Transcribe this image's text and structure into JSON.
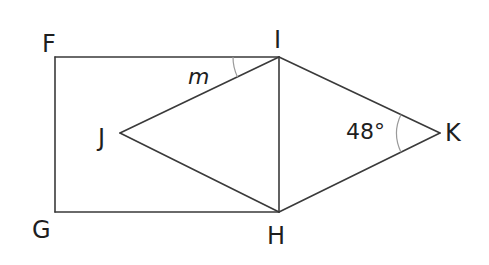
{
  "diagram": {
    "points": {
      "F": {
        "label": "F",
        "x": 55,
        "y": 57
      },
      "I": {
        "label": "I",
        "x": 279,
        "y": 57
      },
      "G": {
        "label": "G",
        "x": 55,
        "y": 212
      },
      "H": {
        "label": "H",
        "x": 279,
        "y": 212
      },
      "J": {
        "label": "J",
        "x": 120,
        "y": 133
      },
      "K": {
        "label": "K",
        "x": 440,
        "y": 133
      }
    },
    "segments": [
      "FI",
      "FG",
      "GH",
      "IH",
      "JI",
      "JH",
      "IK",
      "HK"
    ],
    "angles": [
      {
        "vertex": "I",
        "between": [
          "IF",
          "IJ"
        ],
        "label": "m",
        "style": "italic"
      },
      {
        "vertex": "K",
        "between": [
          "KI",
          "KH"
        ],
        "label": "48°"
      }
    ]
  }
}
